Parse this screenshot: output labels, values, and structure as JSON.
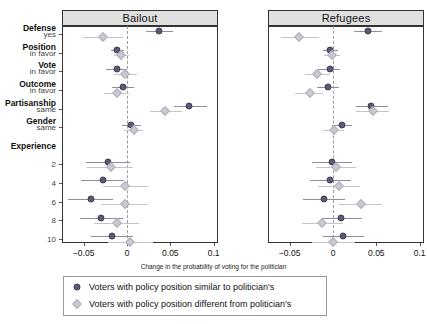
{
  "chart_data": {
    "type": "scatter",
    "title": "",
    "xlabel": "Change in the probability of voting for the politician",
    "ylabel": "",
    "xlim": [
      -0.075,
      0.105
    ],
    "xticks": [
      -0.05,
      0,
      0.05,
      0.1
    ],
    "xticklabels": [
      "−0.05",
      "0",
      "0.05",
      "0.1"
    ],
    "grid": false,
    "zero_reference_line": 0,
    "legend_position": "bottom",
    "panels": [
      "Bailout",
      "Refugees"
    ],
    "groups": [
      {
        "group": "Defense",
        "sub": "yes"
      },
      {
        "group": "Position",
        "sub": "in favor"
      },
      {
        "group": "Vote",
        "sub": "in favor"
      },
      {
        "group": "Outcome",
        "sub": "in favor"
      },
      {
        "group": "Partisanship",
        "sub": "same"
      },
      {
        "group": "Gender",
        "sub": "same"
      },
      {
        "group": "Experience",
        "sub": ""
      },
      {
        "group": "",
        "sub": "2"
      },
      {
        "group": "",
        "sub": "4"
      },
      {
        "group": "",
        "sub": "6"
      },
      {
        "group": "",
        "sub": "8"
      },
      {
        "group": "",
        "sub": "10"
      }
    ],
    "series": [
      {
        "name": "Voters with policy position similar to politician's",
        "marker": "circle",
        "color": "#5b5b75",
        "panels": {
          "Bailout": [
            {
              "row": "Defense yes",
              "estimate": 0.037,
              "lo": 0.022,
              "hi": 0.053
            },
            {
              "row": "Position in favor",
              "estimate": -0.011,
              "lo": -0.018,
              "hi": -0.004
            },
            {
              "row": "Vote in favor",
              "estimate": -0.012,
              "lo": -0.024,
              "hi": 0.0
            },
            {
              "row": "Outcome in favor",
              "estimate": -0.005,
              "lo": -0.017,
              "hi": 0.008
            },
            {
              "row": "Partisanship same",
              "estimate": 0.072,
              "lo": 0.054,
              "hi": 0.092
            },
            {
              "row": "Gender same",
              "estimate": 0.005,
              "lo": -0.006,
              "hi": 0.016
            },
            {
              "row": "Experience 2",
              "estimate": -0.022,
              "lo": -0.047,
              "hi": 0.003
            },
            {
              "row": "Experience 4",
              "estimate": -0.028,
              "lo": -0.053,
              "hi": -0.003
            },
            {
              "row": "Experience 6",
              "estimate": -0.042,
              "lo": -0.068,
              "hi": -0.016
            },
            {
              "row": "Experience 8",
              "estimate": -0.03,
              "lo": -0.054,
              "hi": -0.005
            },
            {
              "row": "Experience 10",
              "estimate": -0.017,
              "lo": -0.041,
              "hi": 0.007
            }
          ],
          "Refugees": [
            {
              "row": "Defense yes",
              "estimate": 0.04,
              "lo": 0.024,
              "hi": 0.057
            },
            {
              "row": "Position in favor",
              "estimate": -0.003,
              "lo": -0.011,
              "hi": 0.006
            },
            {
              "row": "Vote in favor",
              "estimate": -0.004,
              "lo": -0.017,
              "hi": 0.008
            },
            {
              "row": "Outcome in favor",
              "estimate": -0.006,
              "lo": -0.018,
              "hi": 0.007
            },
            {
              "row": "Partisanship same",
              "estimate": 0.044,
              "lo": 0.026,
              "hi": 0.063
            },
            {
              "row": "Gender same",
              "estimate": 0.01,
              "lo": -0.001,
              "hi": 0.022
            },
            {
              "row": "Experience 2",
              "estimate": -0.001,
              "lo": -0.024,
              "hi": 0.022
            },
            {
              "row": "Experience 4",
              "estimate": -0.003,
              "lo": -0.027,
              "hi": 0.021
            },
            {
              "row": "Experience 6",
              "estimate": -0.01,
              "lo": -0.035,
              "hi": 0.014
            },
            {
              "row": "Experience 8",
              "estimate": 0.009,
              "lo": -0.014,
              "hi": 0.033
            },
            {
              "row": "Experience 10",
              "estimate": 0.012,
              "lo": -0.012,
              "hi": 0.036
            }
          ]
        }
      },
      {
        "name": "Voters with policy position different from politician's",
        "marker": "diamond",
        "color": "#c9c9d2",
        "panels": {
          "Bailout": [
            {
              "row": "Defense yes",
              "estimate": -0.028,
              "lo": -0.051,
              "hi": -0.005
            },
            {
              "row": "Position in favor",
              "estimate": -0.007,
              "lo": -0.015,
              "hi": 0.002
            },
            {
              "row": "Vote in favor",
              "estimate": -0.002,
              "lo": -0.015,
              "hi": 0.012
            },
            {
              "row": "Outcome in favor",
              "estimate": -0.012,
              "lo": -0.026,
              "hi": 0.002
            },
            {
              "row": "Partisanship same",
              "estimate": 0.044,
              "lo": 0.026,
              "hi": 0.064
            },
            {
              "row": "Gender same",
              "estimate": 0.008,
              "lo": -0.004,
              "hi": 0.019
            },
            {
              "row": "Experience 2",
              "estimate": -0.019,
              "lo": -0.046,
              "hi": 0.007
            },
            {
              "row": "Experience 4",
              "estimate": -0.002,
              "lo": -0.028,
              "hi": 0.024
            },
            {
              "row": "Experience 6",
              "estimate": -0.002,
              "lo": -0.029,
              "hi": 0.024
            },
            {
              "row": "Experience 8",
              "estimate": -0.012,
              "lo": -0.038,
              "hi": 0.014
            },
            {
              "row": "Experience 10",
              "estimate": 0.004,
              "lo": -0.022,
              "hi": 0.03
            }
          ],
          "Refugees": [
            {
              "row": "Defense yes",
              "estimate": -0.039,
              "lo": -0.06,
              "hi": -0.016
            },
            {
              "row": "Position in favor",
              "estimate": -0.001,
              "lo": -0.01,
              "hi": 0.008
            },
            {
              "row": "Vote in favor",
              "estimate": -0.018,
              "lo": -0.032,
              "hi": -0.004
            },
            {
              "row": "Outcome in favor",
              "estimate": -0.027,
              "lo": -0.044,
              "hi": -0.011
            },
            {
              "row": "Partisanship same",
              "estimate": 0.046,
              "lo": 0.027,
              "hi": 0.065
            },
            {
              "row": "Gender same",
              "estimate": 0.001,
              "lo": -0.011,
              "hi": 0.013
            },
            {
              "row": "Experience 2",
              "estimate": 0.003,
              "lo": -0.02,
              "hi": 0.027
            },
            {
              "row": "Experience 4",
              "estimate": 0.007,
              "lo": -0.017,
              "hi": 0.031
            },
            {
              "row": "Experience 6",
              "estimate": 0.032,
              "lo": 0.007,
              "hi": 0.057
            },
            {
              "row": "Experience 8",
              "estimate": -0.013,
              "lo": -0.036,
              "hi": 0.011
            },
            {
              "row": "Experience 10",
              "estimate": 0.0,
              "lo": -0.024,
              "hi": 0.025
            }
          ]
        }
      }
    ]
  }
}
